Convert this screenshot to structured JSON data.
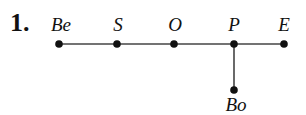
{
  "problem_number": "1.",
  "nodes": [
    {
      "id": "Be",
      "label": "Be",
      "x": 59,
      "y": 44
    },
    {
      "id": "S",
      "label": "S",
      "x": 117,
      "y": 44
    },
    {
      "id": "O",
      "label": "O",
      "x": 174,
      "y": 44
    },
    {
      "id": "P",
      "label": "P",
      "x": 234,
      "y": 44
    },
    {
      "id": "E",
      "label": "E",
      "x": 284,
      "y": 44
    },
    {
      "id": "Bo",
      "label": "Bo",
      "x": 234,
      "y": 90
    }
  ],
  "edges": [
    [
      "Be",
      "S"
    ],
    [
      "S",
      "O"
    ],
    [
      "O",
      "P"
    ],
    [
      "P",
      "E"
    ],
    [
      "P",
      "Bo"
    ]
  ],
  "colors": {
    "line": "#444444",
    "node": "#111111"
  }
}
